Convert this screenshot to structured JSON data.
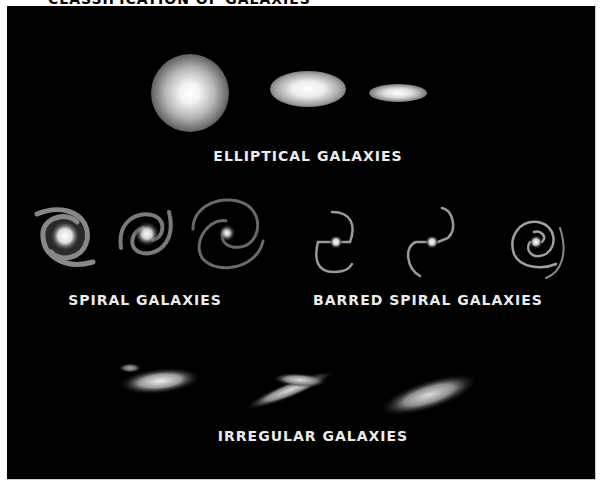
{
  "title": "CLASSIFICATION OF GALAXIES",
  "categories": {
    "elliptical": {
      "label": "ELLIPTICAL GALAXIES",
      "count": 3
    },
    "spiral": {
      "label": "SPIRAL GALAXIES",
      "count": 3
    },
    "barred_spiral": {
      "label": "BARRED SPIRAL GALAXIES",
      "count": 3
    },
    "irregular": {
      "label": "IRREGULAR GALAXIES",
      "count": 3
    }
  },
  "colors": {
    "background": "#000000",
    "text": "#ececec",
    "galaxy": "#ffffff"
  }
}
